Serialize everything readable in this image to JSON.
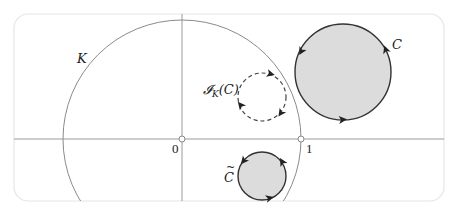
{
  "diagram": {
    "type": "inversion-in-circle",
    "labels": {
      "circle_K": "K",
      "circle_C": "C",
      "inverse_circle": "𝓘",
      "inverse_sub": "K",
      "inverse_arg": "(C)",
      "conjugate_circle": "C",
      "conjugate_mark": "~",
      "origin": "0",
      "unit_point": "1"
    },
    "colors": {
      "frame": "#e6e6e6",
      "axis": "#9a9a9a",
      "circle_K": "#8a8a8a",
      "circle_stroke": "#333333",
      "circle_fill": "#dcdcdc",
      "dashed_stroke": "#444444"
    },
    "elements": {
      "origin": {
        "x": 182,
        "y": 139
      },
      "unit_point": {
        "x": 301,
        "y": 139
      },
      "K": {
        "cx": 182,
        "cy": 139,
        "r": 119
      },
      "C": {
        "cx": 343,
        "cy": 72,
        "r": 48,
        "filled": true
      },
      "I_K_C": {
        "cx": 262,
        "cy": 97,
        "r": 24,
        "dashed": true
      },
      "C_tilde": {
        "cx": 262,
        "cy": 176,
        "r": 24,
        "filled": true
      }
    }
  }
}
